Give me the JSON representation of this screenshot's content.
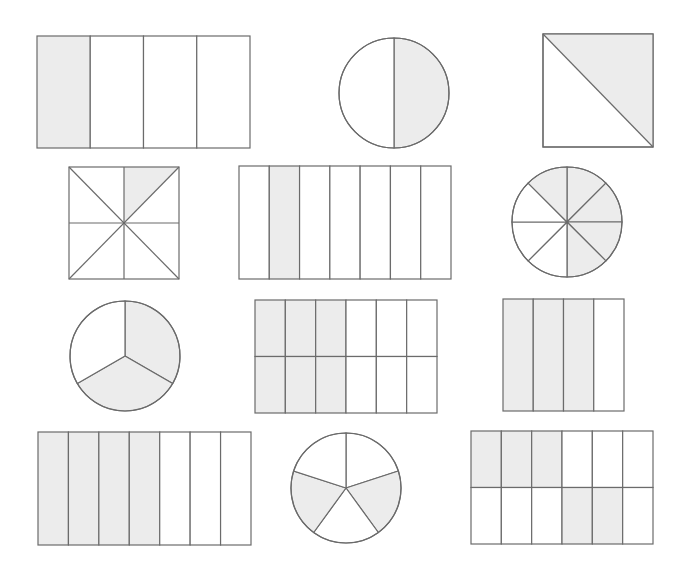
{
  "colors": {
    "shade": "#ececec",
    "line": "#6b6b6b",
    "background": "#ffffff"
  },
  "shapes": [
    {
      "id": "r1c1",
      "type": "rect-columns",
      "x": 37,
      "y": 36,
      "w": 213,
      "h": 112,
      "cols": 4,
      "rows": 1,
      "shaded": [
        [
          0,
          0
        ]
      ],
      "fraction": "1/4"
    },
    {
      "id": "r1c2",
      "type": "circle-sectors",
      "cx": 394,
      "cy": 93,
      "r": 55,
      "parts": 2,
      "start_deg": -90,
      "shaded": [
        0
      ],
      "fraction": "1/2"
    },
    {
      "id": "r1c3",
      "type": "square-diagonal",
      "x": 543,
      "y": 34,
      "w": 110,
      "h": 113,
      "shaded": "upper-right",
      "fraction": "1/2"
    },
    {
      "id": "r2c1",
      "type": "square-eighths",
      "x": 69,
      "y": 167,
      "w": 110,
      "h": 112,
      "shaded": [
        0
      ],
      "fraction": "1/8"
    },
    {
      "id": "r2c2",
      "type": "rect-columns",
      "x": 239,
      "y": 166,
      "w": 212,
      "h": 113,
      "cols": 7,
      "rows": 1,
      "shaded": [
        [
          1,
          0
        ]
      ],
      "fraction": "1/7"
    },
    {
      "id": "r2c3",
      "type": "circle-sectors",
      "cx": 567,
      "cy": 222,
      "r": 55,
      "parts": 8,
      "start_deg": -90,
      "shaded": [
        0,
        1,
        2,
        3
      ],
      "fraction": "4/8",
      "note": "one top-left sector also shaded",
      "extra_shaded": [
        7
      ]
    },
    {
      "id": "r3c1",
      "type": "circle-sectors",
      "cx": 125,
      "cy": 356,
      "r": 55,
      "parts": 3,
      "start_deg": -90,
      "shaded": [
        0,
        1
      ],
      "fraction": "2/3"
    },
    {
      "id": "r3c2",
      "type": "rect-columns",
      "x": 255,
      "y": 300,
      "w": 182,
      "h": 113,
      "cols": 6,
      "rows": 2,
      "shaded": [
        [
          0,
          0
        ],
        [
          1,
          0
        ],
        [
          2,
          0
        ],
        [
          0,
          1
        ],
        [
          1,
          1
        ],
        [
          2,
          1
        ]
      ],
      "fraction": "6/12"
    },
    {
      "id": "r3c3",
      "type": "rect-columns",
      "x": 503,
      "y": 299,
      "w": 121,
      "h": 112,
      "cols": 4,
      "rows": 1,
      "shaded": [
        [
          0,
          0
        ],
        [
          1,
          0
        ],
        [
          2,
          0
        ]
      ],
      "fraction": "3/4"
    },
    {
      "id": "r4c1",
      "type": "rect-columns",
      "x": 38,
      "y": 432,
      "w": 213,
      "h": 113,
      "cols": 7,
      "rows": 1,
      "shaded": [
        [
          0,
          0
        ],
        [
          1,
          0
        ],
        [
          2,
          0
        ],
        [
          3,
          0
        ]
      ],
      "fraction": "4/7"
    },
    {
      "id": "r4c2",
      "type": "circle-sectors",
      "cx": 346,
      "cy": 488,
      "r": 55,
      "parts": 5,
      "start_deg": -90,
      "shaded": [
        1,
        3
      ],
      "fraction": "2/5"
    },
    {
      "id": "r4c3",
      "type": "rect-columns",
      "x": 471,
      "y": 431,
      "w": 182,
      "h": 113,
      "cols": 6,
      "rows": 2,
      "shaded": [
        [
          0,
          0
        ],
        [
          1,
          0
        ],
        [
          2,
          0
        ],
        [
          3,
          1
        ],
        [
          4,
          1
        ]
      ],
      "fraction": "5/12"
    }
  ]
}
